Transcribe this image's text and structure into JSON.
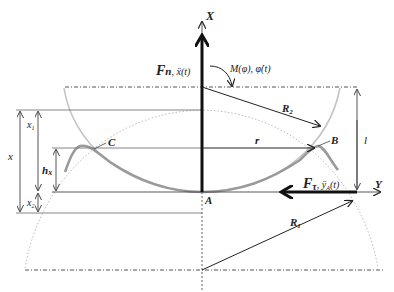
{
  "diagram": {
    "axes": {
      "x_axis_label": "X",
      "y_axis_label": "Y"
    },
    "points": {
      "A": "A",
      "B": "B",
      "C": "C"
    },
    "forces": {
      "normal_force": "F",
      "normal_force_sub": "n",
      "normal_force_rate": ", ẍ(t)",
      "tangential_force": "F",
      "tangential_force_sub": "τ",
      "tangential_force_rate": ", ÿ",
      "tangential_force_rate_sub": "A",
      "tangential_force_rate_tail": "(t)",
      "moment": "M(φ), φ̇(t)"
    },
    "dimensions": {
      "x": "x",
      "x1": "x",
      "x1_sub": "1",
      "x2": "x",
      "x2_sub": "2",
      "hx": "h",
      "hx_sub": "x",
      "r": "r",
      "l": "l",
      "R1": "R",
      "R1_sub": "1",
      "R2": "R",
      "R2_sub": "2"
    },
    "colors": {
      "line": "#222222",
      "thin_line": "#555555",
      "curve_gray": "#a8a8a8",
      "curve_light": "#c8c8c8",
      "dotted_arc": "#b8b8b8"
    }
  }
}
